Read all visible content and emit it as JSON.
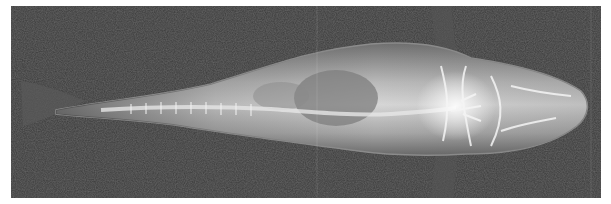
{
  "image": {
    "subject": "fish radiograph (dorsal view)",
    "colors": {
      "background": "#3a3a3a",
      "body_light": "#d8d8d8",
      "body_mid": "#9a9a9a",
      "bladder": "#7e7e7e",
      "bone": "#f2f2f2",
      "outline": "#8c8c8c"
    }
  }
}
